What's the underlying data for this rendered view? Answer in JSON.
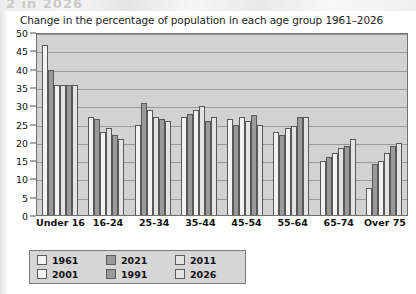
{
  "scan_artifact": {
    "top_text_fragment": "2 in 2026"
  },
  "chart_data": {
    "type": "bar",
    "title": "Change in the percentage of population in each age group 1961–2026",
    "xlabel": "",
    "ylabel": "",
    "ylim": [
      0,
      50
    ],
    "ytick_step": 5,
    "yticks": [
      "0",
      "5",
      "10",
      "15",
      "20",
      "25",
      "30",
      "35",
      "40",
      "45",
      "50"
    ],
    "grid": true,
    "legend_position": "bottom-left",
    "categories": [
      "Under 16",
      "16-24",
      "25-34",
      "35-44",
      "45-54",
      "55-64",
      "65-74",
      "Over 75"
    ],
    "series": [
      {
        "name": "1961",
        "color": "#f2f2f2",
        "values": [
          47,
          27,
          25,
          27,
          26.5,
          23,
          15,
          7.5
        ]
      },
      {
        "name": "1991",
        "color": "#9a9a9a",
        "values": [
          40,
          26.5,
          31,
          28,
          25,
          22,
          16,
          14
        ]
      },
      {
        "name": "2001",
        "color": "#f2f2f2",
        "values": [
          36,
          23,
          29,
          29,
          27,
          24,
          17,
          15
        ]
      },
      {
        "name": "2011",
        "color": "#e3e3e3",
        "values": [
          36,
          24,
          27,
          30,
          26,
          24.5,
          18.5,
          17
        ]
      },
      {
        "name": "2021",
        "color": "#9a9a9a",
        "values": [
          36,
          22,
          26.5,
          26,
          27.5,
          27,
          19,
          19
        ]
      },
      {
        "name": "2026",
        "color": "#e3e3e3",
        "values": [
          36,
          21,
          26,
          27,
          25,
          27,
          21,
          20
        ]
      }
    ]
  },
  "legend": {
    "entries": [
      {
        "label": "1961",
        "color": "#f2f2f2"
      },
      {
        "label": "2001",
        "color": "#f2f2f2"
      },
      {
        "label": "2021",
        "color": "#9a9a9a"
      },
      {
        "label": "1991",
        "color": "#9a9a9a"
      },
      {
        "label": "2011",
        "color": "#e3e3e3"
      },
      {
        "label": "2026",
        "color": "#e3e3e3"
      }
    ]
  },
  "colors": {
    "plot_background": "#d2d2d2",
    "gridline": "#9a9a9a",
    "axis": "#6f6f6f",
    "bar_outline": "#585858",
    "legend_background": "#d6d6d6",
    "page_background": "#ffffff"
  }
}
